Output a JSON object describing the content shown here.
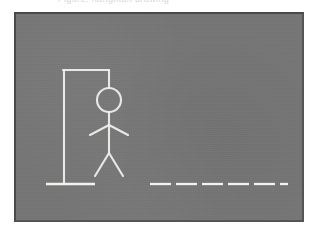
{
  "app": {
    "title": "Hangman",
    "caption_fragment": "Figure: hangman  drawing"
  },
  "board": {
    "background_color": "#767676",
    "border_color": "#4a4a4a",
    "chalk_color": "#eeeeea",
    "frame": {
      "x": 14,
      "y": 12,
      "width": 290,
      "height": 210
    }
  },
  "gallows": {
    "label": "gallows",
    "post": {
      "x1": 62,
      "y1": 68,
      "x2": 62,
      "y2": 182
    },
    "beam": {
      "x1": 62,
      "y1": 68,
      "x2": 107,
      "y2": 68
    },
    "rope": {
      "x1": 107,
      "y1": 68,
      "x2": 107,
      "y2": 85
    }
  },
  "figure": {
    "label": "hangman-figure",
    "parts_drawn": 6,
    "parts_total": 6,
    "head": {
      "cx": 107,
      "cy": 97,
      "r": 12
    },
    "body": {
      "x1": 107,
      "y1": 109,
      "x2": 107,
      "y2": 150
    },
    "left_arm": {
      "x1": 107,
      "y1": 122,
      "x2": 88,
      "y2": 132
    },
    "right_arm": {
      "x1": 107,
      "y1": 122,
      "x2": 126,
      "y2": 132
    },
    "left_leg": {
      "x1": 107,
      "y1": 150,
      "x2": 93,
      "y2": 173
    },
    "right_leg": {
      "x1": 107,
      "y1": 150,
      "x2": 121,
      "y2": 173
    }
  },
  "ground": {
    "label": "ground-line",
    "x1": 44,
    "y1": 182,
    "x2": 93,
    "y2": 182
  },
  "word": {
    "label": "word-blanks",
    "letter_count": 6,
    "revealed": [
      "",
      "",
      "",
      "",
      "",
      ""
    ],
    "dash_y": 182,
    "dashes": [
      {
        "x1": 148,
        "x2": 169
      },
      {
        "x1": 174,
        "x2": 195
      },
      {
        "x1": 200,
        "x2": 221
      },
      {
        "x1": 226,
        "x2": 247
      },
      {
        "x1": 252,
        "x2": 273
      },
      {
        "x1": 278,
        "x2": 284
      }
    ]
  }
}
